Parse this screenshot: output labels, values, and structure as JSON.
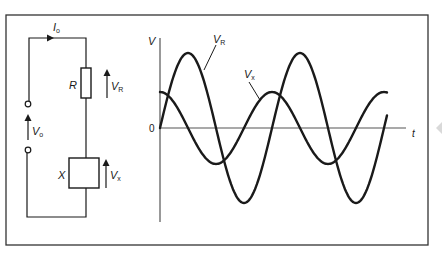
{
  "figure": {
    "type": "circuit-and-waveform",
    "colors": {
      "line": "#1a1a1a",
      "frame": "#333333",
      "axis": "#555555",
      "arrow_mark": "#d9d9d9"
    }
  },
  "circuit": {
    "current_label": "I",
    "current_sub": "o",
    "source_label": "V",
    "source_sub": "o",
    "resistor_label": "R",
    "resistor_voltage_label": "V",
    "resistor_voltage_sub": "R",
    "reactance_label": "X",
    "reactance_voltage_label": "V",
    "reactance_voltage_sub": "x"
  },
  "graph": {
    "y_axis_label": "V",
    "x_axis_label": "t",
    "origin_label": "0",
    "curve_labels": {
      "vr": {
        "main": "V",
        "sub": "R"
      },
      "vx": {
        "main": "V",
        "sub": "x"
      }
    }
  },
  "chart_data": {
    "type": "line",
    "title": "",
    "xlabel": "t",
    "ylabel": "V",
    "grid": false,
    "x_range_periods": [
      0,
      2.03
    ],
    "series": [
      {
        "name": "V_R",
        "amplitude": 1.0,
        "phase_deg": 0,
        "form": "sin"
      },
      {
        "name": "V_x",
        "amplitude": 0.48,
        "phase_deg": 90,
        "form": "sin"
      }
    ]
  }
}
